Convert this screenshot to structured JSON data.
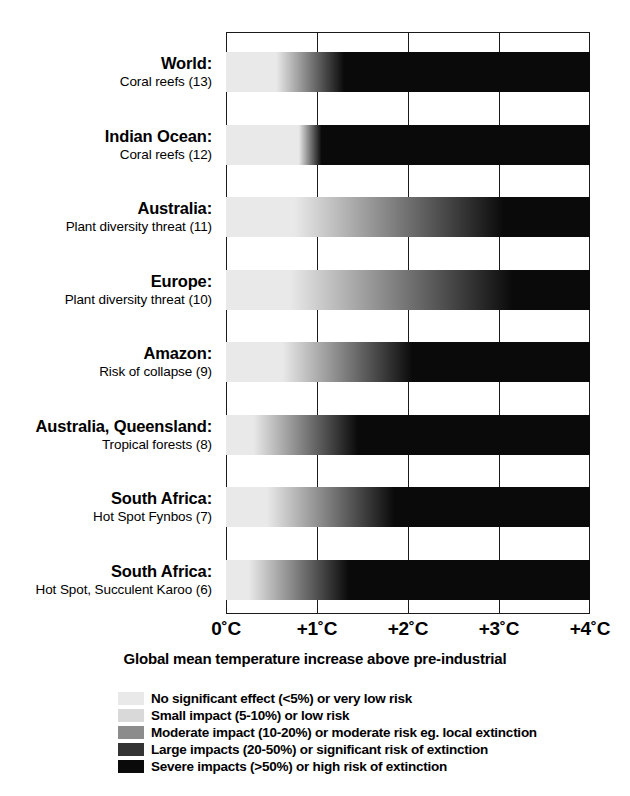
{
  "chart_data": {
    "type": "bar",
    "title": "",
    "xlabel": "Global mean temperature increase above pre-industrial",
    "ylabel": "",
    "xlim": [
      0,
      4
    ],
    "x_ticks": [
      {
        "value": 0,
        "label": "0˚C"
      },
      {
        "value": 1,
        "label": "+1˚C"
      },
      {
        "value": 2,
        "label": "+2˚C"
      },
      {
        "value": 3,
        "label": "+3˚C"
      },
      {
        "value": 4,
        "label": "+4˚C"
      }
    ],
    "grid": true,
    "legend_position": "bottom",
    "categories": [
      "World: Coral reefs (13)",
      "Indian Ocean: Coral reefs (12)",
      "Australia: Plant diversity threat (11)",
      "Europe: Plant diversity threat (10)",
      "Amazon: Risk of collapse (9)",
      "Australia, Queensland: Tropical forests (8)",
      "South Africa: Hot Spot Fynbos (7)",
      "South Africa: Hot Spot, Succulent Karoo (6)"
    ],
    "series": [
      {
        "name": "Impact severity gradient",
        "values": [
          {
            "region": "World:",
            "detail": "Coral reefs (13)",
            "index": 13,
            "gradient_start_c": 0.55,
            "gradient_end_c": 1.3,
            "severity_start": "no-significant-effect",
            "severity_end": "severe-impacts"
          },
          {
            "region": "Indian Ocean:",
            "detail": "Coral reefs (12)",
            "index": 12,
            "gradient_start_c": 0.8,
            "gradient_end_c": 1.05,
            "severity_start": "no-significant-effect",
            "severity_end": "severe-impacts"
          },
          {
            "region": "Australia:",
            "detail": "Plant diversity threat (11)",
            "index": 11,
            "gradient_start_c": 0.75,
            "gradient_end_c": 3.05,
            "severity_start": "no-significant-effect",
            "severity_end": "severe-impacts"
          },
          {
            "region": "Europe:",
            "detail": "Plant diversity threat (10)",
            "index": 10,
            "gradient_start_c": 0.7,
            "gradient_end_c": 3.15,
            "severity_start": "no-significant-effect",
            "severity_end": "severe-impacts"
          },
          {
            "region": "Amazon:",
            "detail": "Risk of collapse (9)",
            "index": 9,
            "gradient_start_c": 0.62,
            "gradient_end_c": 2.05,
            "severity_start": "no-significant-effect",
            "severity_end": "severe-impacts"
          },
          {
            "region": "Australia, Queensland:",
            "detail": "Tropical forests (8)",
            "index": 8,
            "gradient_start_c": 0.3,
            "gradient_end_c": 1.45,
            "severity_start": "no-significant-effect",
            "severity_end": "severe-impacts"
          },
          {
            "region": "South Africa:",
            "detail": "Hot Spot Fynbos  (7)",
            "index": 7,
            "gradient_start_c": 0.45,
            "gradient_end_c": 1.85,
            "severity_start": "no-significant-effect",
            "severity_end": "severe-impacts"
          },
          {
            "region": "South Africa:",
            "detail": "Hot Spot, Succulent Karoo (6)",
            "index": 6,
            "gradient_start_c": 0.25,
            "gradient_end_c": 1.35,
            "severity_start": "no-significant-effect",
            "severity_end": "severe-impacts"
          }
        ]
      }
    ],
    "legend": [
      {
        "label": "No significant effect (<5%) or very low risk",
        "color": "#e9e9e9"
      },
      {
        "label": "Small impact (5-10%) or low risk",
        "color": "#d9d9d9"
      },
      {
        "label": "Moderate impact (10-20%) or moderate risk eg. local extinction",
        "color": "#8c8c8c"
      },
      {
        "label": "Large impacts (20-50%) or significant risk of extinction",
        "color": "#343434"
      },
      {
        "label": "Severe impacts (>50%) or high risk of extinction",
        "color": "#0a0a0a"
      }
    ]
  },
  "colors": {
    "axis": "#1a1a1a",
    "background": "#ffffff",
    "bar_light": "#e9e9e9",
    "bar_dark": "#0a0a0a"
  }
}
